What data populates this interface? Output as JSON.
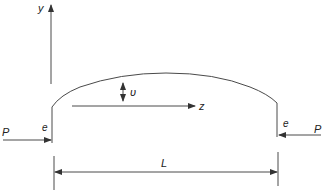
{
  "diagram": {
    "type": "eccentrically loaded curved column (arch) schematic",
    "colors": {
      "line": "#4a4a4a",
      "text": "#222222",
      "background": "#ffffff"
    },
    "labels": {
      "y_axis": "y",
      "z_axis": "z",
      "deflection": "υ",
      "load_left": "P",
      "load_right": "P",
      "eccentricity_left": "e",
      "eccentricity_right": "e",
      "length": "L"
    },
    "elements": [
      {
        "name": "y-axis",
        "kind": "arrow",
        "direction": "up"
      },
      {
        "name": "z-axis",
        "kind": "arrow",
        "direction": "right"
      },
      {
        "name": "curved-member",
        "kind": "arc"
      },
      {
        "name": "deflection-arrow",
        "kind": "double-arrow",
        "direction": "vertical"
      },
      {
        "name": "load-left",
        "kind": "arrow",
        "direction": "right"
      },
      {
        "name": "load-right",
        "kind": "arrow",
        "direction": "left"
      },
      {
        "name": "length-dimension",
        "kind": "double-arrow",
        "direction": "horizontal"
      }
    ]
  }
}
